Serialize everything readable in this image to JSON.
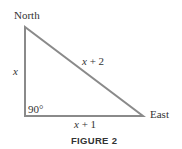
{
  "figure": {
    "caption": "FIGURE 2",
    "vertices": {
      "north": {
        "label": "North"
      },
      "east": {
        "label": "East"
      },
      "corner": {
        "angle_label": "90°"
      }
    },
    "sides": {
      "vertical": {
        "var": "x",
        "suffix": ""
      },
      "hypotenuse": {
        "var": "x",
        "suffix": " + 2"
      },
      "horizontal": {
        "var": "x",
        "suffix": " + 1"
      }
    },
    "colors": {
      "stroke": "#8a8a8a",
      "text": "#333333"
    }
  }
}
